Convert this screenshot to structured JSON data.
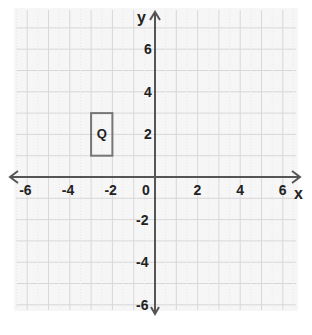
{
  "diagram": {
    "type": "coordinate-plane",
    "x_axis": {
      "label": "x",
      "min": -6,
      "max": 6,
      "tick_labels": [
        "-6",
        "-4",
        "-2",
        "0",
        "2",
        "4",
        "6"
      ]
    },
    "y_axis": {
      "label": "y",
      "min": -6,
      "max": 6,
      "tick_labels": [
        "6",
        "4",
        "2",
        "-2",
        "-4",
        "-6"
      ]
    },
    "grid": {
      "spacing": 1,
      "range_x": [
        -6.5,
        6.5
      ],
      "range_y": [
        -6.5,
        7.5
      ]
    },
    "shapes": [
      {
        "name": "Q",
        "type": "rectangle",
        "x_min": -3,
        "x_max": -2,
        "y_min": 1,
        "y_max": 3,
        "label": "Q"
      }
    ],
    "colors": {
      "axis": "#555555",
      "grid": "#d8d8d8",
      "shape": "#777777",
      "background": "#f7f7f7"
    }
  }
}
